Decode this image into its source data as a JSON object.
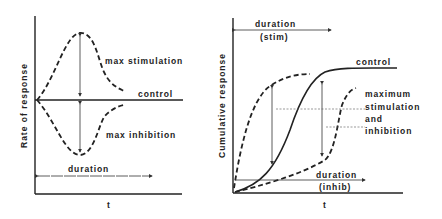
{
  "left_panel": {
    "y_axis_label": "Rate of response",
    "x_axis_label": "t",
    "labels": {
      "stimulation": "max stimulation",
      "control": "control",
      "inhibition": "max inhibition",
      "duration": "duration"
    }
  },
  "right_panel": {
    "y_axis_label": "Cumulative response",
    "x_axis_label": "t",
    "labels": {
      "duration_stim_1": "duration",
      "duration_stim_2": "(stim)",
      "control": "control",
      "max_1": "maximum",
      "max_2": "stimulation",
      "max_3": "and",
      "max_4": "inhibition",
      "duration_inhib_1": "duration",
      "duration_inhib_2": "(inhib)"
    }
  }
}
